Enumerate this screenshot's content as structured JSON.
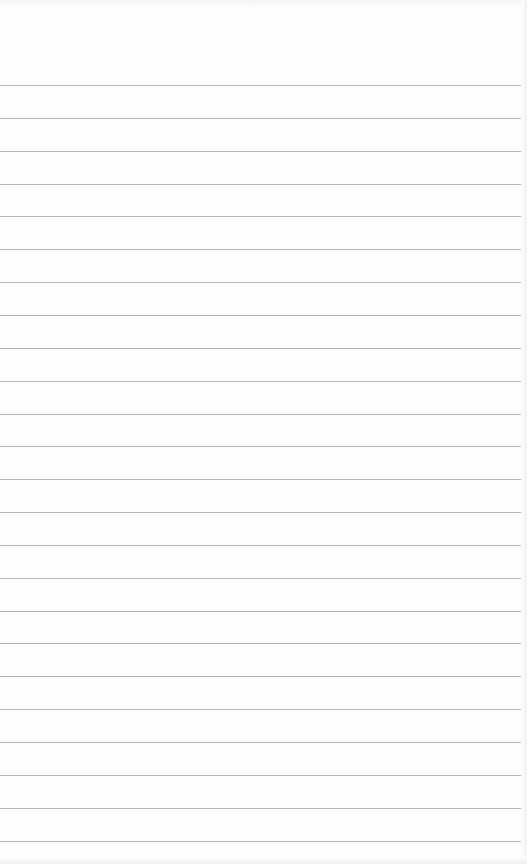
{
  "image": {
    "description": "Blank sheet of white lined notebook paper",
    "background_color": "#fefefe",
    "rule_color": "#a9a9a9",
    "rule_count": 24,
    "first_rule_y": 85,
    "rule_spacing_px": 32.85
  }
}
